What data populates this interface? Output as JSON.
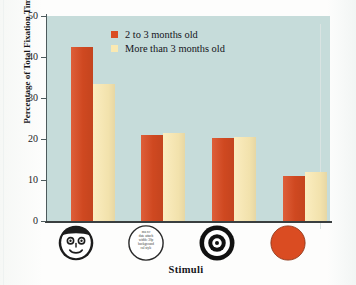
{
  "chart_data": {
    "type": "bar",
    "title": "",
    "subtitle": "",
    "xlabel": "Stimuli",
    "ylabel": "Percentage of Total Fixation Time",
    "categories": [
      "face",
      "scrambled face",
      "bullseye",
      "solid circle"
    ],
    "category_icon_names": [
      "smiling-face-stimulus-icon",
      "scrambled-text-circle-stimulus-icon",
      "bullseye-stimulus-icon",
      "solid-orange-circle-stimulus-icon"
    ],
    "series": [
      {
        "name": "2 to 3 months old",
        "color": "#da4c22",
        "values": [
          42.5,
          21.0,
          20.3,
          11.0
        ]
      },
      {
        "name": "More than 3 months old",
        "color": "#fae9b2",
        "values": [
          33.5,
          21.5,
          20.5,
          12.0
        ]
      }
    ],
    "ylim": [
      0,
      50
    ],
    "yticks": [
      0,
      10,
      20,
      30,
      40,
      50
    ],
    "ytick_labels": [
      "0",
      "10",
      "20",
      "30",
      "40",
      "50"
    ],
    "grid": false,
    "legend_position": "top-left-inside",
    "plot_background_color": "#c6dcda",
    "page_background_color": "#fdfdfc"
  },
  "legend": {
    "entries": [
      {
        "label": "2 to 3 months old",
        "color": "#da4c22"
      },
      {
        "label": "More than 3 months old",
        "color": "#fae9b2"
      }
    ]
  },
  "stimuli": {
    "scrambled_lines": [
      "ma 89",
      "date attach",
      "width: 30p",
      "background",
      "cal style"
    ]
  }
}
